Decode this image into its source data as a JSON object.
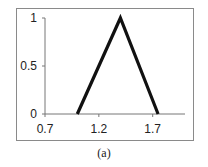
{
  "chart_data": {
    "type": "line",
    "title": "",
    "caption": "(a)",
    "xlabel": "",
    "ylabel": "",
    "x": [
      1.0,
      1.4,
      1.75
    ],
    "series": [
      {
        "name": "membership",
        "values": [
          0,
          1,
          0
        ],
        "color": "#111111"
      }
    ],
    "xlim": [
      0.7,
      2.0
    ],
    "ylim": [
      0,
      1
    ],
    "x_ticks": [
      0.7,
      1.2,
      1.7
    ],
    "x_tick_labels": [
      "0.7",
      "1.2",
      "1.7"
    ],
    "y_ticks": [
      0,
      0.5,
      1
    ],
    "y_tick_labels": [
      "0",
      "0.5",
      "1"
    ],
    "grid": false,
    "legend": null
  }
}
